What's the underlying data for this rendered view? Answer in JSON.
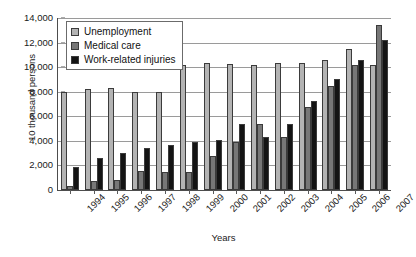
{
  "chart_data": {
    "type": "bar",
    "title": "",
    "xlabel": "Years",
    "ylabel": "10 thousand persons",
    "ylim": [
      0,
      14000
    ],
    "ytick_step": 2000,
    "yticks": [
      "0",
      "2,000",
      "4,000",
      "6,000",
      "8,000",
      "10,000",
      "12,000",
      "14,000"
    ],
    "ytick_values": [
      0,
      2000,
      4000,
      6000,
      8000,
      10000,
      12000,
      14000
    ],
    "grid": "horizontal",
    "legend_position": "upper-left-inside",
    "categories": [
      "1994",
      "1995",
      "1996",
      "1997",
      "1998",
      "1999",
      "2000",
      "2001",
      "2002",
      "2003",
      "2004",
      "2005",
      "2006",
      "2007"
    ],
    "series": [
      {
        "name": "Unemployment",
        "color": "#b3b3b3",
        "values": [
          7950,
          8200,
          8300,
          7950,
          7950,
          10150,
          10350,
          10250,
          10200,
          10350,
          10350,
          10600,
          11450,
          10200
        ]
      },
      {
        "name": "Medical care",
        "color": "#777777",
        "values": [
          350,
          700,
          800,
          1550,
          1500,
          1450,
          2800,
          3900,
          5350,
          4300,
          6750,
          8450,
          10150,
          13450
        ]
      },
      {
        "name": "Work-related injuries",
        "color": "#141414",
        "values": [
          1850,
          2600,
          3050,
          3450,
          3700,
          3900,
          4050,
          5350,
          4300,
          5400,
          7250,
          9000,
          10600,
          12200
        ]
      }
    ]
  },
  "legend": {
    "items": [
      {
        "label": "Unemployment",
        "color": "#b3b3b3"
      },
      {
        "label": "Medical care",
        "color": "#777777"
      },
      {
        "label": "Work-related injuries",
        "color": "#141414"
      }
    ]
  }
}
